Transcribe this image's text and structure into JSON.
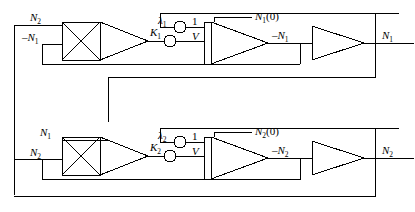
{
  "diagram": {
    "type": "analog-computer-block-diagram",
    "stroke_color": "#000000",
    "background_color": "#ffffff",
    "channels": [
      {
        "id": "channel-1",
        "multiplier": {
          "name": "multiplier-1",
          "symbol": "X",
          "input_top": "N2",
          "input_bottom": "-N1"
        },
        "pot_lambda": {
          "name": "lambda-1-pot",
          "label": "λ",
          "subscript": "1"
        },
        "pot_gain": {
          "name": "k-1-pot",
          "label": "K",
          "subscript": "1"
        },
        "integrator": {
          "name": "integrator-1",
          "input_one": "1",
          "input_v": "V",
          "initial_condition": "N₁(0)",
          "ic_base": "N",
          "ic_sub": "1",
          "ic_tail": "(0)",
          "output": "-N1"
        },
        "inverter": {
          "name": "inverter-1",
          "output": "N1"
        }
      },
      {
        "id": "channel-2",
        "multiplier": {
          "name": "multiplier-2",
          "symbol": "X",
          "input_top": "N1",
          "input_bottom": "N2"
        },
        "pot_lambda": {
          "name": "lambda-2-pot",
          "label": "λ",
          "subscript": "2"
        },
        "pot_gain": {
          "name": "k-2-pot",
          "label": "K",
          "subscript": "2"
        },
        "integrator": {
          "name": "integrator-2",
          "input_one": "1",
          "input_v": "V",
          "initial_condition": "N₂(0)",
          "ic_base": "N",
          "ic_sub": "2",
          "ic_tail": "(0)",
          "output": "-N2"
        },
        "inverter": {
          "name": "inverter-2",
          "output": "N2"
        }
      }
    ],
    "labels": {
      "ch1_mult_in_top_base": "N",
      "ch1_mult_in_top_sub": "2",
      "ch1_mult_in_bot_sign": "–",
      "ch1_mult_in_bot_base": "N",
      "ch1_mult_in_bot_sub": "1",
      "ch1_lambda_base": "λ",
      "ch1_lambda_sub": "1",
      "ch1_k_base": "K",
      "ch1_k_sub": "1",
      "ch1_one": "1",
      "ch1_v": "V",
      "ch1_ic_base": "N",
      "ch1_ic_sub": "1",
      "ch1_ic_tail": "(0)",
      "ch1_int_out_sign": "–",
      "ch1_int_out_base": "N",
      "ch1_int_out_sub": "1",
      "ch1_inv_out_base": "N",
      "ch1_inv_out_sub": "1",
      "ch2_mult_in_top_base": "N",
      "ch2_mult_in_top_sub": "1",
      "ch2_mult_in_bot_base": "N",
      "ch2_mult_in_bot_sub": "2",
      "ch2_lambda_base": "λ",
      "ch2_lambda_sub": "2",
      "ch2_k_base": "K",
      "ch2_k_sub": "2",
      "ch2_one": "1",
      "ch2_v": "V",
      "ch2_ic_base": "N",
      "ch2_ic_sub": "2",
      "ch2_ic_tail": "(0)",
      "ch2_int_out_sign": "–",
      "ch2_int_out_base": "N",
      "ch2_int_out_sub": "2",
      "ch2_inv_out_base": "N",
      "ch2_inv_out_sub": "2"
    }
  }
}
